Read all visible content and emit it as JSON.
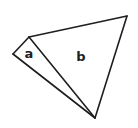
{
  "diagram": {
    "type": "geometry-figure",
    "background": "#ffffff",
    "stroke_color": "#1e1e1e",
    "vertices": {
      "left": {
        "x": 13,
        "y": 54
      },
      "top": {
        "x": 29,
        "y": 37
      },
      "top_right": {
        "x": 127,
        "y": 16
      },
      "bottom": {
        "x": 95,
        "y": 118
      }
    },
    "regions": [
      {
        "id": "a",
        "label": "a",
        "vertices": [
          "left",
          "top",
          "bottom"
        ],
        "label_pos": {
          "x": 29,
          "y": 53
        }
      },
      {
        "id": "b",
        "label": "b",
        "vertices": [
          "top",
          "top_right",
          "bottom"
        ],
        "label_pos": {
          "x": 81,
          "y": 56
        }
      }
    ],
    "labels": {
      "a": "a",
      "b": "b"
    }
  }
}
